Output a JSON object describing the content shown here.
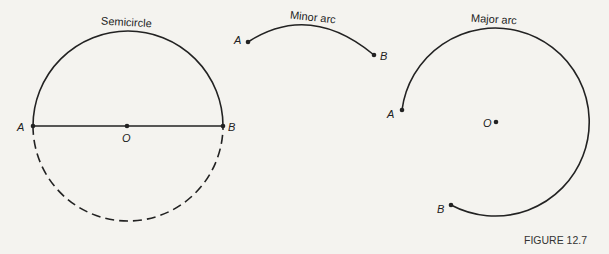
{
  "figures": {
    "semicircle": {
      "title": "Semicircle",
      "point_a": "A",
      "point_b": "B",
      "center": "O"
    },
    "minor_arc": {
      "title": "Minor arc",
      "point_a": "A",
      "point_b": "B"
    },
    "major_arc": {
      "title": "Major arc",
      "point_a": "A",
      "point_b": "B",
      "center": "O"
    }
  },
  "caption": "FIGURE 12.7",
  "colors": {
    "ink": "#222222",
    "paper": "#f4f3ef"
  }
}
